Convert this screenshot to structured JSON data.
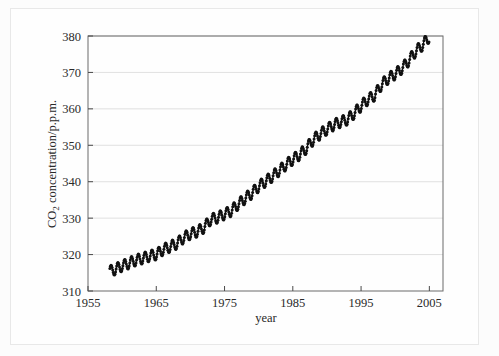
{
  "figure": {
    "background_color": "#fcfcfc",
    "frame_color": "#e8e8e8"
  },
  "chart_data": {
    "type": "line",
    "title": "",
    "subtitle": "",
    "xlabel": "year",
    "ylabel": "CO2 concentration/p.p.m.",
    "ylabel_display": "CO",
    "ylabel_sub": "2",
    "ylabel_rest": " concentration/p.p.m.",
    "xlim": [
      1955,
      2007
    ],
    "ylim": [
      310,
      380
    ],
    "xticks": [
      1955,
      1965,
      1975,
      1985,
      1995,
      2005
    ],
    "yticks": [
      310,
      320,
      330,
      340,
      350,
      360,
      370,
      380
    ],
    "xtick_labels": [
      "1955",
      "1965",
      "1975",
      "1985",
      "1995",
      "2005"
    ],
    "ytick_labels": [
      "310",
      "320",
      "330",
      "340",
      "350",
      "360",
      "370",
      "380"
    ],
    "grid": true,
    "grid_axis": "y",
    "grid_color": "#d8d8d8",
    "legend": false,
    "legend_position": "none",
    "marker": "circle",
    "marker_color": "#111111",
    "line_color": "#111111",
    "seasonal_amplitude_ppm": 3.0,
    "annotation": "Monthly mean atmospheric CO2 concentration showing a rising trend with annual seasonal oscillation",
    "series": [
      {
        "name": "CO2 concentration",
        "x_start": 1958.2,
        "x_end": 2005.0,
        "samples_per_year": 12,
        "annual_mean": [
          {
            "year": 1958,
            "value": 315.3
          },
          {
            "year": 1959,
            "value": 315.98
          },
          {
            "year": 1960,
            "value": 316.91
          },
          {
            "year": 1961,
            "value": 317.64
          },
          {
            "year": 1962,
            "value": 318.45
          },
          {
            "year": 1963,
            "value": 318.99
          },
          {
            "year": 1964,
            "value": 319.62
          },
          {
            "year": 1965,
            "value": 320.04
          },
          {
            "year": 1966,
            "value": 321.38
          },
          {
            "year": 1967,
            "value": 322.16
          },
          {
            "year": 1968,
            "value": 323.04
          },
          {
            "year": 1969,
            "value": 324.62
          },
          {
            "year": 1970,
            "value": 325.68
          },
          {
            "year": 1971,
            "value": 326.32
          },
          {
            "year": 1972,
            "value": 327.45
          },
          {
            "year": 1973,
            "value": 329.68
          },
          {
            "year": 1974,
            "value": 330.18
          },
          {
            "year": 1975,
            "value": 331.11
          },
          {
            "year": 1976,
            "value": 332.04
          },
          {
            "year": 1977,
            "value": 333.83
          },
          {
            "year": 1978,
            "value": 335.4
          },
          {
            "year": 1979,
            "value": 336.84
          },
          {
            "year": 1980,
            "value": 338.75
          },
          {
            "year": 1981,
            "value": 340.11
          },
          {
            "year": 1982,
            "value": 341.45
          },
          {
            "year": 1983,
            "value": 343.05
          },
          {
            "year": 1984,
            "value": 344.65
          },
          {
            "year": 1985,
            "value": 346.12
          },
          {
            "year": 1986,
            "value": 347.42
          },
          {
            "year": 1987,
            "value": 349.19
          },
          {
            "year": 1988,
            "value": 351.57
          },
          {
            "year": 1989,
            "value": 353.12
          },
          {
            "year": 1990,
            "value": 354.39
          },
          {
            "year": 1991,
            "value": 355.61
          },
          {
            "year": 1992,
            "value": 356.45
          },
          {
            "year": 1993,
            "value": 357.1
          },
          {
            "year": 1994,
            "value": 358.83
          },
          {
            "year": 1995,
            "value": 360.82
          },
          {
            "year": 1996,
            "value": 362.61
          },
          {
            "year": 1997,
            "value": 363.73
          },
          {
            "year": 1998,
            "value": 366.7
          },
          {
            "year": 1999,
            "value": 368.38
          },
          {
            "year": 2000,
            "value": 369.55
          },
          {
            "year": 2001,
            "value": 371.14
          },
          {
            "year": 2002,
            "value": 373.28
          },
          {
            "year": 2003,
            "value": 375.8
          },
          {
            "year": 2004,
            "value": 377.52
          },
          {
            "year": 2005,
            "value": 379.8
          }
        ]
      }
    ]
  }
}
